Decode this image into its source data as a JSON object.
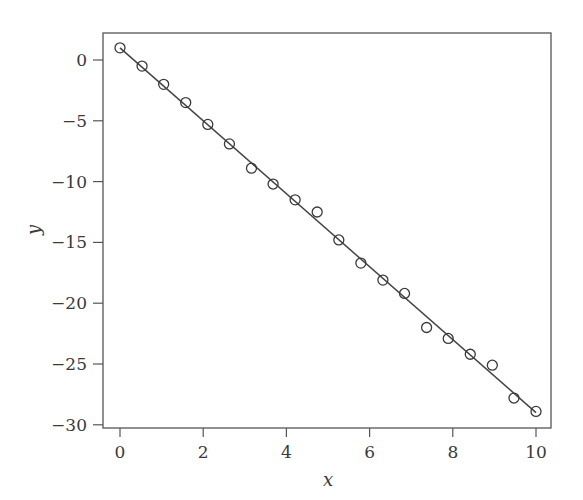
{
  "chart_data": {
    "type": "scatter",
    "title": "",
    "xlabel": "x",
    "ylabel": "y",
    "xlim": [
      -0.4,
      10.4
    ],
    "ylim": [
      -30.2,
      2.2
    ],
    "grid": false,
    "legend": null,
    "x_ticks": [
      0,
      2,
      4,
      6,
      8,
      10
    ],
    "x_tick_labels": [
      "0",
      "2",
      "4",
      "6",
      "8",
      "10"
    ],
    "y_ticks": [
      0,
      -5,
      -10,
      -15,
      -20,
      -25,
      -30
    ],
    "y_tick_labels": [
      "0",
      "−5",
      "−10",
      "−15",
      "−20",
      "−25",
      "−30"
    ],
    "series": [
      {
        "name": "observations",
        "kind": "scatter",
        "marker": "open-circle",
        "x": [
          0,
          0.53,
          1.05,
          1.58,
          2.11,
          2.63,
          3.16,
          3.68,
          4.21,
          4.74,
          5.26,
          5.79,
          6.32,
          6.84,
          7.37,
          7.89,
          8.42,
          8.95,
          9.47,
          10
        ],
        "y": [
          1.0,
          -0.5,
          -2.0,
          -3.5,
          -5.3,
          -6.9,
          -8.9,
          -10.2,
          -11.5,
          -12.5,
          -14.8,
          -16.7,
          -18.1,
          -19.2,
          -22.0,
          -22.9,
          -24.2,
          -25.1,
          -27.8,
          -28.9
        ]
      },
      {
        "name": "fitted line",
        "kind": "line",
        "x": [
          0,
          10
        ],
        "y": [
          1.0,
          -29.0
        ]
      }
    ]
  },
  "colors": {
    "ink": "#3a3a3a",
    "frame": "#555555",
    "background": "#ffffff"
  }
}
